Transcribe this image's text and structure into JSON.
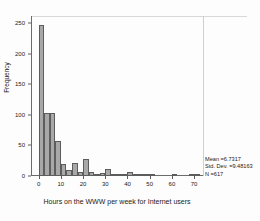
{
  "chart_data": {
    "type": "bar",
    "title": "",
    "subtitle": "",
    "xlabel": "Hours on the WWW per week for Internet users",
    "ylabel": "Frequency",
    "xlim": [
      -3,
      74
    ],
    "ylim": [
      0,
      262
    ],
    "grid": false,
    "legend": "none",
    "bin_width": 2.5,
    "x_ticks": [
      0,
      10,
      20,
      30,
      40,
      50,
      60,
      70
    ],
    "x_tick_labels": [
      "0",
      "10",
      "20",
      "30",
      "40",
      "50",
      "60",
      "70"
    ],
    "y_ticks": [
      0,
      50,
      100,
      150,
      200,
      250
    ],
    "y_tick_labels": [
      "0",
      "50",
      "100",
      "150",
      "200",
      "250"
    ],
    "bin_centers": [
      1.25,
      3.75,
      6.25,
      8.75,
      11.25,
      13.75,
      16.25,
      18.75,
      21.25,
      23.75,
      26.25,
      28.75,
      31.25,
      33.75,
      36.25,
      38.75,
      41.25,
      43.75,
      46.25,
      48.75,
      51.25,
      61.25,
      68.75,
      71.25
    ],
    "values": [
      248,
      103,
      104,
      57,
      20,
      10,
      22,
      7,
      28,
      6,
      2,
      5,
      12,
      2,
      2,
      1,
      6,
      1,
      4,
      3,
      1,
      3,
      2,
      3
    ],
    "bars": [
      {
        "center": 1.25,
        "value": 248
      },
      {
        "center": 3.75,
        "value": 103
      },
      {
        "center": 6.25,
        "value": 104
      },
      {
        "center": 8.75,
        "value": 57
      },
      {
        "center": 11.25,
        "value": 20
      },
      {
        "center": 13.75,
        "value": 10
      },
      {
        "center": 16.25,
        "value": 22
      },
      {
        "center": 18.75,
        "value": 7
      },
      {
        "center": 21.25,
        "value": 28
      },
      {
        "center": 23.75,
        "value": 6
      },
      {
        "center": 26.25,
        "value": 2
      },
      {
        "center": 28.75,
        "value": 5
      },
      {
        "center": 31.25,
        "value": 12
      },
      {
        "center": 33.75,
        "value": 2
      },
      {
        "center": 36.25,
        "value": 2
      },
      {
        "center": 38.75,
        "value": 1
      },
      {
        "center": 41.25,
        "value": 6
      },
      {
        "center": 43.75,
        "value": 1
      },
      {
        "center": 46.25,
        "value": 4
      },
      {
        "center": 48.75,
        "value": 3
      },
      {
        "center": 51.25,
        "value": 1
      },
      {
        "center": 61.25,
        "value": 3
      },
      {
        "center": 68.75,
        "value": 2
      },
      {
        "center": 71.25,
        "value": 3
      }
    ],
    "annotations": {
      "mean_label": "Mean =6.7317",
      "std_dev_label": "Std. Dev. =9.48163",
      "n_label": "N =617"
    },
    "colors": {
      "bar_fill": "#a8a8a8",
      "bar_edge": "#5d5d5d",
      "axis": "#6b6b6b",
      "text": "#1a1a1a",
      "background": "#ffffff"
    }
  },
  "statistics": {
    "mean": "Mean =6.7317",
    "std_dev": "Std. Dev. =9.48163",
    "n": "N =617"
  }
}
